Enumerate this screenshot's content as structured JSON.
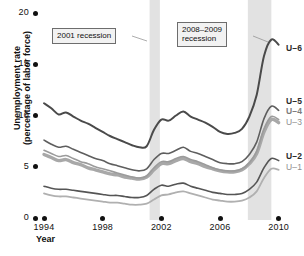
{
  "chart_data": {
    "type": "line",
    "title": "",
    "xlabel": "Year",
    "ylabel_line1": "Unemployment rate",
    "ylabel_line2": "(percentage of labor force)",
    "xlim": [
      1994,
      2010.5
    ],
    "ylim": [
      0,
      20
    ],
    "xticks": [
      1994,
      1998,
      2002,
      2006,
      2010
    ],
    "xtick_labels": [
      "1994",
      "1998",
      "2002",
      "2006",
      "2010"
    ],
    "yticks": [
      0,
      5,
      10,
      15,
      20
    ],
    "ytick_labels": [
      "0",
      "5",
      "10",
      "15",
      "20"
    ],
    "grid": false,
    "legend_position": "right-inline",
    "annotations": [
      {
        "id": "rec2001",
        "text": "2001 recession",
        "lines": [
          "2001 recession"
        ]
      },
      {
        "id": "rec2008",
        "text": "2008-2009 recession",
        "lines": [
          "2008–2009",
          "recession"
        ]
      }
    ],
    "shaded_bands": [
      {
        "name": "2001 recession",
        "x0": 2001.2,
        "x1": 2001.9,
        "color": "#e2e2e2"
      },
      {
        "name": "2008-2009 recession",
        "x0": 2007.9,
        "x1": 2009.5,
        "color": "#e2e2e2"
      }
    ],
    "x": [
      1994.0,
      1994.5,
      1995.0,
      1995.5,
      1996.0,
      1996.5,
      1997.0,
      1997.5,
      1998.0,
      1998.5,
      1999.0,
      1999.5,
      2000.0,
      2000.5,
      2001.0,
      2001.5,
      2002.0,
      2002.5,
      2003.0,
      2003.5,
      2004.0,
      2004.5,
      2005.0,
      2005.5,
      2006.0,
      2006.5,
      2007.0,
      2007.5,
      2008.0,
      2008.5,
      2009.0,
      2009.5,
      2010.0
    ],
    "series": [
      {
        "name": "U-6",
        "color": "#4a4a4a",
        "width": 2.0,
        "label": "U–6",
        "label_style": "bold-dark",
        "values": [
          11.2,
          10.7,
          10.1,
          10.3,
          9.9,
          9.5,
          9.2,
          8.8,
          8.4,
          8.0,
          7.7,
          7.4,
          7.1,
          6.9,
          7.0,
          8.6,
          9.6,
          9.5,
          10.0,
          10.4,
          9.9,
          9.6,
          9.3,
          8.9,
          8.4,
          8.2,
          8.3,
          8.7,
          9.9,
          12.0,
          15.8,
          17.4,
          16.9
        ]
      },
      {
        "name": "U-5",
        "color": "#5e5e5e",
        "width": 1.6,
        "label": "U–5",
        "label_style": "bold-dark",
        "values": [
          7.6,
          7.2,
          6.9,
          7.0,
          6.7,
          6.4,
          6.1,
          5.8,
          5.6,
          5.3,
          5.1,
          4.9,
          4.7,
          4.6,
          4.8,
          5.7,
          6.3,
          6.3,
          6.6,
          6.9,
          6.5,
          6.3,
          6.0,
          5.7,
          5.4,
          5.3,
          5.3,
          5.5,
          6.2,
          7.4,
          9.7,
          10.9,
          10.5
        ]
      },
      {
        "name": "U-4",
        "color": "#9b9b9b",
        "width": 1.6,
        "label": "U–4",
        "label_style": "bold-mid",
        "values": [
          6.6,
          6.3,
          6.0,
          6.1,
          5.8,
          5.5,
          5.3,
          5.0,
          4.8,
          4.6,
          4.4,
          4.2,
          4.0,
          3.9,
          4.1,
          4.9,
          5.5,
          5.5,
          5.8,
          6.0,
          5.7,
          5.5,
          5.2,
          4.9,
          4.7,
          4.6,
          4.6,
          4.8,
          5.4,
          6.5,
          8.7,
          9.9,
          9.6
        ]
      },
      {
        "name": "U-3",
        "color": "#a8a8a8",
        "width": 3.4,
        "label": "U–3",
        "label_style": "lite",
        "values": [
          6.2,
          5.9,
          5.6,
          5.7,
          5.4,
          5.2,
          4.9,
          4.7,
          4.5,
          4.3,
          4.2,
          4.0,
          3.9,
          3.8,
          4.0,
          4.7,
          5.3,
          5.3,
          5.6,
          5.8,
          5.5,
          5.3,
          5.0,
          4.8,
          4.6,
          4.5,
          4.5,
          4.7,
          5.3,
          6.3,
          8.4,
          9.6,
          9.3
        ]
      },
      {
        "name": "U-2",
        "color": "#555555",
        "width": 1.6,
        "label": "U–2",
        "label_style": "bold-dark",
        "values": [
          3.1,
          2.9,
          2.8,
          2.8,
          2.7,
          2.6,
          2.5,
          2.4,
          2.3,
          2.2,
          2.2,
          2.1,
          2.0,
          2.0,
          2.2,
          2.8,
          3.2,
          3.1,
          3.3,
          3.4,
          3.1,
          2.9,
          2.7,
          2.5,
          2.4,
          2.3,
          2.3,
          2.4,
          2.8,
          3.5,
          4.9,
          5.8,
          5.6
        ]
      },
      {
        "name": "U-1",
        "color": "#b0b0b0",
        "width": 1.8,
        "label": "U–1",
        "label_style": "lite",
        "values": [
          2.4,
          2.2,
          2.1,
          2.1,
          2.0,
          1.9,
          1.8,
          1.7,
          1.6,
          1.5,
          1.5,
          1.4,
          1.3,
          1.3,
          1.4,
          1.8,
          2.2,
          2.3,
          2.5,
          2.6,
          2.4,
          2.2,
          2.0,
          1.8,
          1.7,
          1.6,
          1.6,
          1.7,
          2.0,
          2.6,
          3.9,
          4.8,
          4.7
        ]
      }
    ]
  },
  "plot_geometry": {
    "left": 44,
    "right": 286,
    "top": 13,
    "bottom": 218
  }
}
